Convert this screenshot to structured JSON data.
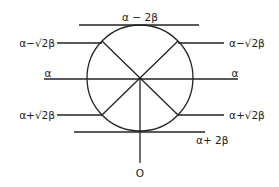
{
  "diagram": {
    "type": "energy-level-circle (Frost circle)",
    "center": {
      "x": 140,
      "y": 78
    },
    "radius": 53,
    "levels": [
      {
        "label": "α − 2β",
        "y": 25,
        "position": "top"
      },
      {
        "label_left": "α−√2β",
        "label_right": "α−√2β",
        "y": 43
      },
      {
        "label_left": "α",
        "label_right": "α",
        "y": 79
      },
      {
        "label_left": "α+√2β",
        "label_right": "α+√2β",
        "y": 115
      },
      {
        "label": "α+ 2β",
        "y": 132,
        "position": "bottom"
      }
    ],
    "origin_label": "O"
  },
  "labels": {
    "top": "α − 2β",
    "upper_left": "α−√2β",
    "upper_right": "α−√2β",
    "mid_left": "α",
    "mid_right": "α",
    "lower_left": "α+√2β",
    "lower_right": "α+√2β",
    "bottom": "α+ 2β",
    "origin": "O"
  }
}
